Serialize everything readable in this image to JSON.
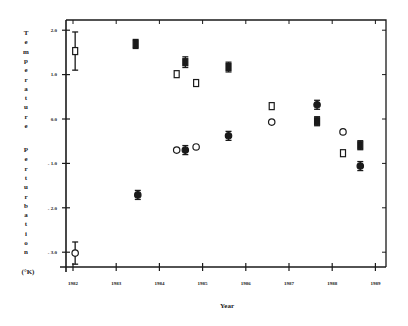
{
  "chart_data": {
    "type": "scatter",
    "title": "",
    "xlabel": "Year",
    "ylabel": "Temperature Perturbation (°K)",
    "ylabel_unit": "(°K)",
    "xlim": [
      1981.95,
      1989.25
    ],
    "ylim": [
      -3.5,
      2.2
    ],
    "x_ticks": [
      "1982",
      "1983",
      "1984",
      "1985",
      "1986",
      "1987",
      "1988",
      "1989"
    ],
    "y_ticks": [
      "2.0",
      "1.0",
      "0.0",
      "- 1.0",
      "- 2.0",
      "- 3.0"
    ],
    "y_tick_values": [
      2.0,
      1.0,
      0.0,
      -1.0,
      -2.0,
      -3.0
    ],
    "grid": false,
    "legend": null,
    "series": [
      {
        "name": "filled-square",
        "marker": "square",
        "filled": true,
        "points": [
          {
            "x": 1983.45,
            "y": 1.69,
            "err": 0.1
          },
          {
            "x": 1984.6,
            "y": 1.28,
            "err": 0.12
          },
          {
            "x": 1985.6,
            "y": 1.17,
            "err": 0.11
          },
          {
            "x": 1987.65,
            "y": -0.05,
            "err": 0.1
          },
          {
            "x": 1988.65,
            "y": -0.59,
            "err": 0.1
          }
        ]
      },
      {
        "name": "open-square",
        "marker": "square",
        "filled": false,
        "points": [
          {
            "x": 1982.05,
            "y": 1.53,
            "err": 0.43
          },
          {
            "x": 1984.4,
            "y": 1.01,
            "err": 0
          },
          {
            "x": 1984.85,
            "y": 0.81,
            "err": 0
          },
          {
            "x": 1986.6,
            "y": 0.29,
            "err": 0
          },
          {
            "x": 1988.25,
            "y": -0.77,
            "err": 0
          }
        ]
      },
      {
        "name": "filled-circle",
        "marker": "circle",
        "filled": true,
        "points": [
          {
            "x": 1983.5,
            "y": -1.71,
            "err": 0.1
          },
          {
            "x": 1984.6,
            "y": -0.7,
            "err": 0.1
          },
          {
            "x": 1985.6,
            "y": -0.38,
            "err": 0.1
          },
          {
            "x": 1987.65,
            "y": 0.32,
            "err": 0.1
          },
          {
            "x": 1988.65,
            "y": -1.06,
            "err": 0.1
          }
        ]
      },
      {
        "name": "open-circle",
        "marker": "circle",
        "filled": false,
        "points": [
          {
            "x": 1982.05,
            "y": -3.02,
            "err": 0.25
          },
          {
            "x": 1984.4,
            "y": -0.7,
            "err": 0
          },
          {
            "x": 1984.85,
            "y": -0.63,
            "err": 0
          },
          {
            "x": 1986.6,
            "y": -0.07,
            "err": 0
          },
          {
            "x": 1988.25,
            "y": -0.29,
            "err": 0
          }
        ]
      }
    ]
  },
  "axis": {
    "ylabel_word1": "Temperature",
    "ylabel_word2": "Perturbation",
    "ylabel_unit": "(°K)",
    "xlabel": "Year"
  }
}
